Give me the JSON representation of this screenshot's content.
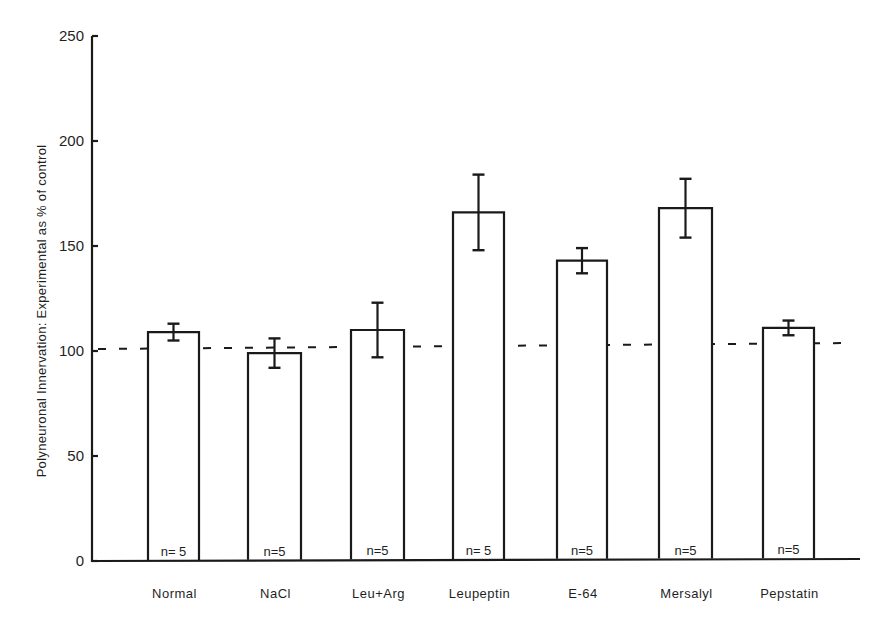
{
  "chart_data": {
    "type": "bar",
    "title": "",
    "xlabel": "",
    "ylabel": "Polyneuronal Innervation: Experimental as % of control",
    "ylim": [
      0,
      250
    ],
    "yticks": [
      0,
      50,
      100,
      150,
      200,
      250
    ],
    "grid": false,
    "legend": null,
    "categories": [
      "Normal",
      "NaCl",
      "Leu+Arg",
      "Leupeptin",
      "E-64",
      "Mersalyl",
      "Pepstatin"
    ],
    "values": [
      109,
      99,
      110,
      166,
      143,
      168,
      111
    ],
    "errors": [
      4,
      7,
      13,
      18,
      6,
      14,
      3.5
    ],
    "n_labels": [
      "n= 5",
      "n=5",
      "n=5",
      "n= 5",
      "n=5",
      "n=5",
      "n=5"
    ],
    "reference_line": {
      "value": 100,
      "style": "dashed",
      "label": "control level"
    }
  }
}
